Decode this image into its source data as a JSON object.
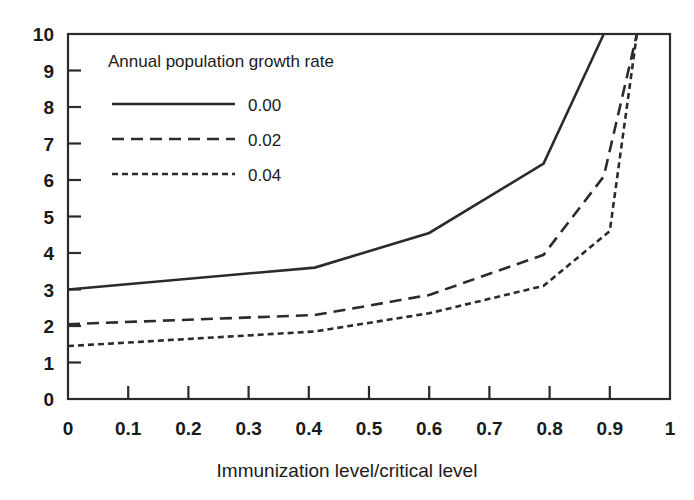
{
  "chart_data": {
    "type": "line",
    "title": "",
    "xlabel": "Immunization level/critical level",
    "ylabel": "",
    "xlim": [
      0,
      1
    ],
    "ylim": [
      0,
      10
    ],
    "grid": false,
    "legend_position": "upper-left-inside",
    "legend_title": "Annual population growth rate",
    "xticks": [
      "0",
      "0.1",
      "0.2",
      "0.3",
      "0.4",
      "0.5",
      "0.6",
      "0.7",
      "0.8",
      "0.9",
      "1"
    ],
    "xtick_values": [
      0,
      0.1,
      0.2,
      0.3,
      0.4,
      0.5,
      0.6,
      0.7,
      0.8,
      0.9,
      1
    ],
    "yticks": [
      "0",
      "1",
      "2",
      "3",
      "4",
      "5",
      "6",
      "7",
      "8",
      "9",
      "10"
    ],
    "ytick_values": [
      0,
      1,
      2,
      3,
      4,
      5,
      6,
      7,
      8,
      9,
      10
    ],
    "series": [
      {
        "name": "0.00",
        "style": "solid",
        "dash": "none",
        "x": [
          0.0,
          0.41,
          0.6,
          0.79,
          0.89
        ],
        "values": [
          3.0,
          3.6,
          4.55,
          6.45,
          10.0
        ]
      },
      {
        "name": "0.02",
        "style": "dashed",
        "dash": "12,7",
        "x": [
          0.0,
          0.41,
          0.6,
          0.79,
          0.89,
          0.945
        ],
        "values": [
          2.05,
          2.3,
          2.85,
          3.95,
          6.1,
          10.0
        ]
      },
      {
        "name": "0.04",
        "style": "dotted",
        "dash": "6,4",
        "x": [
          0.0,
          0.41,
          0.6,
          0.79,
          0.9,
          0.945
        ],
        "values": [
          1.45,
          1.85,
          2.35,
          3.1,
          4.6,
          10.0
        ]
      }
    ]
  },
  "legend": {
    "title": "Annual population growth rate",
    "entries": [
      {
        "label": "0.00",
        "style": "solid"
      },
      {
        "label": "0.02",
        "style": "dashed"
      },
      {
        "label": "0.04",
        "style": "dotted"
      }
    ]
  },
  "axes": {
    "x_title": "Immunization level/critical level"
  },
  "colors": {
    "ink": "#2b2b2b",
    "background": "#ffffff"
  }
}
